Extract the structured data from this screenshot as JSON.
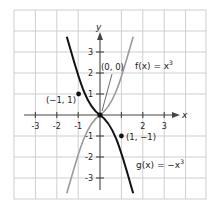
{
  "axes": {
    "x_label": "x",
    "y_label": "y",
    "x_ticks": [
      "-3",
      "-2",
      "-1",
      "2",
      "3"
    ],
    "y_ticks": [
      "3",
      "2",
      "1",
      "-1",
      "-2",
      "-3"
    ]
  },
  "curves": {
    "f": {
      "label": "f(x) = x",
      "exp": "3",
      "color": "#9a9a9a"
    },
    "g": {
      "label": "g(x) = −x",
      "exp": "3",
      "color": "#111111"
    }
  },
  "points": {
    "origin": "(0, 0)",
    "neg_one": "(−1, 1)",
    "pos_one": "(1, −1)"
  },
  "colors": {
    "grid": "#cfcfcf",
    "axis": "#444444"
  }
}
